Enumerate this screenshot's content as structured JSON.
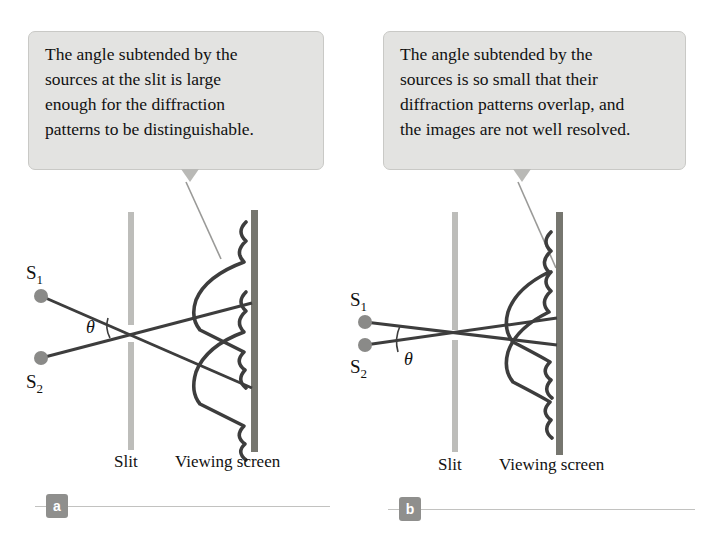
{
  "figure": {
    "colors": {
      "callout_bg": "#e3e3e1",
      "callout_border": "#c9c9c6",
      "slit_bar": "#bdbdba",
      "screen_bar": "#76766f",
      "curve": "#3d3d3d",
      "ray": "#3d3d3d",
      "source_dot": "#8a8a88",
      "badge_bg": "#8f8f8d",
      "rule": "#c2c2c0",
      "leader": "#9a9a98"
    }
  },
  "panels": [
    {
      "id": "a",
      "badge": "a",
      "callout": {
        "lines": [
          "The angle subtended by the",
          "sources at the slit is large",
          "enough for the diffraction",
          "patterns to be distinguishable."
        ]
      },
      "diagram": {
        "source_1_label": "S",
        "source_1_sub": "1",
        "source_2_label": "S",
        "source_2_sub": "2",
        "angle_label": "θ",
        "slit_label": "Slit",
        "screen_label": "Viewing screen",
        "resolved": "resolved",
        "angle_size": "large"
      }
    },
    {
      "id": "b",
      "badge": "b",
      "callout": {
        "lines": [
          "The angle subtended by the",
          "sources is so small that their",
          "diffraction patterns overlap, and",
          "the images are not well resolved."
        ]
      },
      "diagram": {
        "source_1_label": "S",
        "source_1_sub": "1",
        "source_2_label": "S",
        "source_2_sub": "2",
        "angle_label": "θ",
        "slit_label": "Slit",
        "screen_label": "Viewing screen",
        "resolved": "not resolved",
        "angle_size": "small"
      }
    }
  ]
}
